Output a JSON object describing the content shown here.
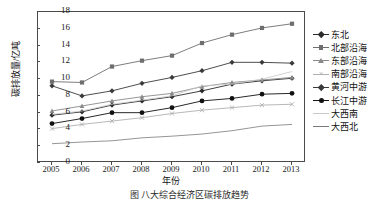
{
  "chart_data": {
    "type": "line",
    "title": "",
    "xlabel": "年份",
    "ylabel": "碳排放量/亿吨",
    "x": [
      2005,
      2006,
      2007,
      2008,
      2009,
      2010,
      2011,
      2012,
      2013
    ],
    "xticklabels": [
      "2005",
      "2006",
      "2007",
      "2008",
      "2009",
      "2010",
      "2011",
      "2012",
      "2013"
    ],
    "yticklabels": [
      "0",
      "2",
      "4",
      "6",
      "8",
      "10",
      "12",
      "14",
      "16",
      "18"
    ],
    "ylim": [
      0,
      18
    ],
    "ytick_step": 2,
    "grid": false,
    "legend_position": "right",
    "series": [
      {
        "name": "东北",
        "marker": "diamond",
        "color": "#2b2b2b",
        "values": [
          5.7,
          6.1,
          6.9,
          7.4,
          7.9,
          8.6,
          9.4,
          9.8,
          10.1
        ]
      },
      {
        "name": "北部沿海",
        "marker": "square",
        "color": "#6e6e6e",
        "values": [
          9.7,
          9.6,
          11.5,
          12.2,
          12.8,
          14.3,
          15.3,
          16.1,
          16.6
        ]
      },
      {
        "name": "东部沿海",
        "marker": "triangle",
        "color": "#8a8a8a",
        "values": [
          6.2,
          6.8,
          7.4,
          7.9,
          8.3,
          9.1,
          9.6,
          9.9,
          10.2
        ]
      },
      {
        "name": "南部沿海",
        "marker": "cross",
        "color": "#b0b0b0",
        "values": [
          4.1,
          4.6,
          5.0,
          5.4,
          5.9,
          6.3,
          6.6,
          6.9,
          7.0
        ]
      },
      {
        "name": "黄河中游",
        "marker": "diamond",
        "color": "#3a3a3a",
        "values": [
          9.2,
          8.0,
          8.6,
          9.5,
          10.2,
          11.0,
          12.0,
          12.0,
          11.9
        ]
      },
      {
        "name": "长江中游",
        "marker": "circle",
        "color": "#111111",
        "values": [
          4.7,
          5.3,
          6.0,
          6.0,
          6.6,
          7.4,
          7.7,
          8.2,
          8.3
        ]
      },
      {
        "name": "大西南",
        "marker": "none",
        "color": "#c8c8c8",
        "values": [
          5.8,
          6.2,
          7.0,
          7.5,
          8.0,
          9.2,
          9.4,
          10.0,
          10.9
        ]
      },
      {
        "name": "大西北",
        "marker": "none",
        "color": "#7a7a7a",
        "values": [
          2.3,
          2.5,
          2.65,
          3.0,
          3.2,
          3.45,
          3.85,
          4.4,
          4.6
        ]
      }
    ]
  },
  "caption": "图     八大综合经济区碳排放趋势",
  "axis": {
    "y_title": "碳排放量/亿吨",
    "x_title": "年份"
  }
}
